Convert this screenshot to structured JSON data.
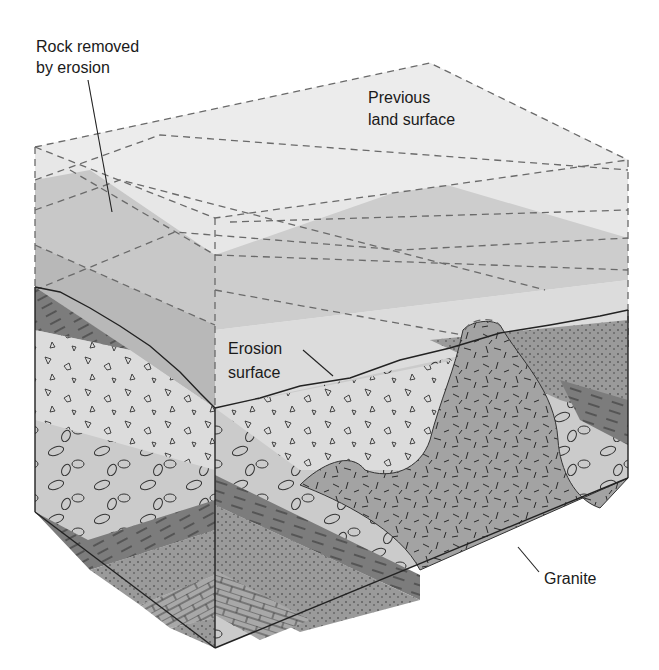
{
  "figure": {
    "type": "block-diagram"
  },
  "labels": {
    "rock_removed": [
      "Rock removed",
      "by erosion"
    ],
    "previous_land": [
      "Previous",
      "land surface"
    ],
    "erosion_surface": [
      "Erosion",
      "surface"
    ],
    "granite": "Granite"
  },
  "colors": {
    "removed_light": "#e6e6e6",
    "removed_mid": "#cfcfcf",
    "removed_dark": "#b4b4b4",
    "conglomerate": "#cdcdcd",
    "breccia": "#dadada",
    "shale": "#7d7d7d",
    "sandstone": "#9c9c9c",
    "limestone": "#a8a8a8",
    "granite": "#a2a2a2",
    "outline": "#222222"
  }
}
